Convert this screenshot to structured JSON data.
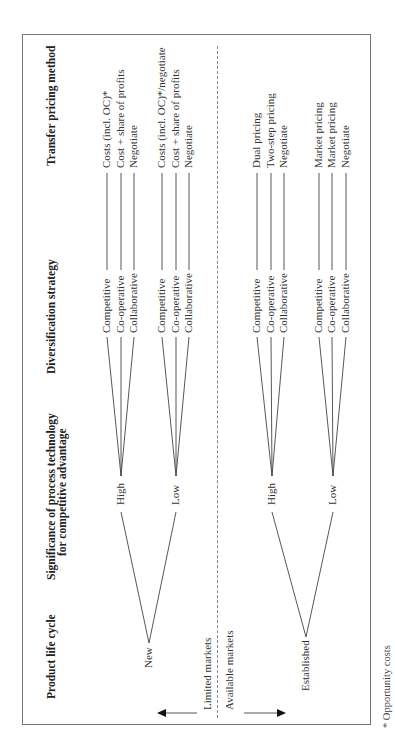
{
  "diagram": {
    "orientation": "rotated 90 degrees counter-clockwise",
    "headers": {
      "product_life_cycle": "Product life cycle",
      "significance_line1": "Significance of process technology",
      "significance_line2": "for competitive advantage",
      "diversification": "Diversification strategy",
      "transfer_pricing": "Transfer pricing method"
    },
    "market_divider": {
      "left_label": "Limited markets",
      "right_label": "Available markets"
    },
    "tree": [
      {
        "life_cycle": "New",
        "branches": [
          {
            "technology": "High",
            "strategies": [
              {
                "strategy": "Competitive",
                "pricing": "Costs (incl. OC)*"
              },
              {
                "strategy": "Co-operative",
                "pricing": "Cost + share of profits"
              },
              {
                "strategy": "Collaborative",
                "pricing": "Negotiate"
              }
            ]
          },
          {
            "technology": "Low",
            "strategies": [
              {
                "strategy": "Competitive",
                "pricing": "Costs (incl. OC)*/negotiate"
              },
              {
                "strategy": "Co-operative",
                "pricing": "Cost + share of profits"
              },
              {
                "strategy": "Collaborative",
                "pricing": "Negotiate"
              }
            ]
          }
        ]
      },
      {
        "life_cycle": "Established",
        "branches": [
          {
            "technology": "High",
            "strategies": [
              {
                "strategy": "Competitive",
                "pricing": "Dual pricing"
              },
              {
                "strategy": "Co-operative",
                "pricing": "Two-step pricing"
              },
              {
                "strategy": "Collaborative",
                "pricing": "Negotiate"
              }
            ]
          },
          {
            "technology": "Low",
            "strategies": [
              {
                "strategy": "Competitive",
                "pricing": "Market pricing"
              },
              {
                "strategy": "Co-operative",
                "pricing": "Market pricing"
              },
              {
                "strategy": "Collaborative",
                "pricing": "Negotiate"
              }
            ]
          }
        ]
      }
    ],
    "footnote": "* Opportunity costs",
    "colors": {
      "line": "#444444",
      "frame": "#777777",
      "text": "#222222"
    }
  }
}
